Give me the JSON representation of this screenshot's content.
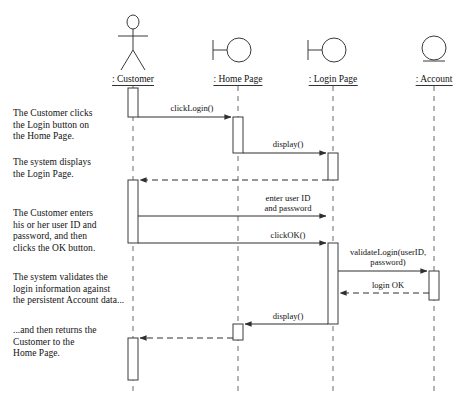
{
  "diagram": {
    "colors": {
      "line": "#3a3a3a",
      "text": "#111111",
      "background": "#ffffff",
      "activation_fill": "#ffffff"
    },
    "lifelines": [
      {
        "id": "customer",
        "label": ": Customer",
        "icon": "actor-stick-figure",
        "x": 133
      },
      {
        "id": "homepage",
        "label": ": Home Page",
        "icon": "boundary-circle-icon",
        "x": 238
      },
      {
        "id": "loginpage",
        "label": ": Login Page",
        "icon": "boundary-circle-icon",
        "x": 333
      },
      {
        "id": "account",
        "label": ": Account",
        "icon": "entity-circle-icon",
        "x": 434
      }
    ],
    "narratives": [
      {
        "id": "n1",
        "text": "The Customer clicks\nthe Login button on\nthe Home Page.",
        "x": 13,
        "y": 108
      },
      {
        "id": "n2",
        "text": "The system displays\nthe Login Page.",
        "x": 13,
        "y": 157
      },
      {
        "id": "n3",
        "text": "The Customer enters\nhis or her user ID and\npassword, and then\nclicks the OK button.",
        "x": 13,
        "y": 208
      },
      {
        "id": "n4",
        "text": "The system validates the\nlogin information against\nthe persistent Account data...",
        "x": 13,
        "y": 272
      },
      {
        "id": "n5",
        "text": "...and then returns the\nCustomer to the\nHome Page.",
        "x": 13,
        "y": 325
      }
    ],
    "messages": [
      {
        "id": "m1",
        "label": "clickLogin()",
        "from": "customer",
        "to": "homepage",
        "y": 117,
        "style": "solid",
        "label_x": 192,
        "label_y": 104
      },
      {
        "id": "m2",
        "label": "display()",
        "from": "homepage",
        "to": "loginpage",
        "y": 153,
        "style": "solid",
        "label_x": 288,
        "label_y": 140
      },
      {
        "id": "m3",
        "label": "",
        "from": "loginpage",
        "to": "customer",
        "y": 180,
        "style": "dashed",
        "label_x": 0,
        "label_y": 0
      },
      {
        "id": "m4",
        "label": "enter user ID\nand password",
        "from": "customer",
        "to": "loginpage",
        "y": 216,
        "style": "solid",
        "label_x": 288,
        "label_y": 194
      },
      {
        "id": "m5",
        "label": "clickOK()",
        "from": "customer",
        "to": "loginpage",
        "y": 243,
        "style": "solid",
        "label_x": 288,
        "label_y": 231
      },
      {
        "id": "m6",
        "label": "validateLogin(userID,\npassword)",
        "from": "loginpage",
        "to": "account",
        "y": 271,
        "style": "solid",
        "label_x": 388,
        "label_y": 248
      },
      {
        "id": "m7",
        "label": "login OK",
        "from": "account",
        "to": "loginpage",
        "y": 293,
        "style": "dashed",
        "label_x": 388,
        "label_y": 281
      },
      {
        "id": "m8",
        "label": "display()",
        "from": "loginpage",
        "to": "homepage",
        "y": 324,
        "style": "solid",
        "label_x": 288,
        "label_y": 312
      },
      {
        "id": "m9",
        "label": "",
        "from": "homepage",
        "to": "customer",
        "y": 338,
        "style": "dashed",
        "label_x": 0,
        "label_y": 0
      }
    ],
    "activations": [
      {
        "id": "a1",
        "lifeline": "customer",
        "top": 88,
        "bottom": 117
      },
      {
        "id": "a2",
        "lifeline": "homepage",
        "top": 117,
        "bottom": 153
      },
      {
        "id": "a3",
        "lifeline": "loginpage",
        "top": 153,
        "bottom": 180
      },
      {
        "id": "a4",
        "lifeline": "customer",
        "top": 180,
        "bottom": 243
      },
      {
        "id": "a5",
        "lifeline": "loginpage",
        "top": 216,
        "bottom": 243
      },
      {
        "id": "a6",
        "lifeline": "loginpage",
        "top": 243,
        "bottom": 324
      },
      {
        "id": "a7",
        "lifeline": "account",
        "top": 271,
        "bottom": 300
      },
      {
        "id": "a8",
        "lifeline": "homepage",
        "top": 324,
        "bottom": 340
      },
      {
        "id": "a9",
        "lifeline": "customer",
        "top": 338,
        "bottom": 380
      }
    ]
  }
}
